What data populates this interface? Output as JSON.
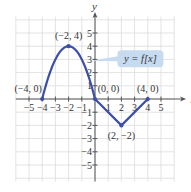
{
  "chart_data": {
    "type": "line",
    "title": "",
    "xlabel": "x",
    "ylabel": "y",
    "xlim": [
      -6,
      6
    ],
    "ylim": [
      -6,
      6
    ],
    "grid": true,
    "x_ticks": [
      -5,
      -4,
      -3,
      -2,
      -1,
      1,
      2,
      3,
      4,
      5
    ],
    "y_ticks": [
      -5,
      -4,
      -3,
      -2,
      -1,
      1,
      2,
      3,
      4,
      5
    ],
    "x_tick_labels": [
      "−5",
      "−4",
      "−3",
      "−2",
      "−1",
      "1",
      "2",
      "3",
      "4",
      "5"
    ],
    "y_tick_labels": [
      "−5",
      "−4",
      "−3",
      "−2",
      "−1",
      "1",
      "2",
      "3",
      "4",
      "5"
    ],
    "series": [
      {
        "name": "y = f(x)",
        "color": "#3b4fa8",
        "segments": [
          {
            "shape": "parabola",
            "from": [
              -4,
              0
            ],
            "vertex": [
              -2,
              4
            ],
            "to": [
              0,
              0
            ]
          },
          {
            "shape": "line",
            "from": [
              0,
              0
            ],
            "to": [
              2,
              -2
            ]
          },
          {
            "shape": "line",
            "from": [
              2,
              -2
            ],
            "to": [
              4,
              0
            ]
          }
        ],
        "key_points": [
          {
            "x": -4,
            "y": 0,
            "label": "(−4, 0)"
          },
          {
            "x": -2,
            "y": 4,
            "label": "(−2, 4)"
          },
          {
            "x": 0,
            "y": 0,
            "label": "(0, 0)"
          },
          {
            "x": 2,
            "y": -2,
            "label": "(2, −2)"
          },
          {
            "x": 4,
            "y": 0,
            "label": "(4, 0)"
          }
        ]
      }
    ],
    "annotations": [
      {
        "text": "y = f[x]",
        "type": "callout",
        "points_to": [
          -0.3,
          2.9
        ]
      }
    ],
    "colors": {
      "curve": "#3b4fa8",
      "grid": "#dcdcdc",
      "axis": "#555555",
      "callout_fill": "#c6dbef"
    }
  }
}
